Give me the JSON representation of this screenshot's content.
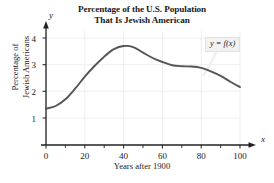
{
  "chart_data": {
    "type": "line",
    "title": "Percentage of the U.S. Population That Is Jewish American",
    "title_line1": "Percentage of the U.S. Population",
    "title_line2": "That Is Jewish American",
    "xlabel": "Years after 1900",
    "ylabel": "Percentage of Jewish Americans",
    "ylabel_line1": "Percentage of",
    "ylabel_line2": "Jewish Americans",
    "x_axis_variable": "x",
    "y_axis_variable": "y",
    "xlim": [
      0,
      105
    ],
    "ylim": [
      0,
      4.35
    ],
    "xticks": [
      0,
      20,
      40,
      60,
      80,
      100
    ],
    "xtick_labels": [
      "0",
      "20",
      "40",
      "60",
      "80",
      "100"
    ],
    "xminorticks": [
      10,
      30,
      50,
      70,
      90
    ],
    "yticks": [
      1,
      2,
      3,
      4
    ],
    "ytick_labels": [
      "1",
      "2",
      "3",
      "4"
    ],
    "grid": true,
    "grid_color": "#e8e8e8",
    "legend": "y = f(x)",
    "legend_position": "upper-right",
    "curve_color": "#555555",
    "curve_width": 1.9,
    "x": [
      0,
      5,
      10,
      15,
      20,
      25,
      30,
      35,
      40,
      45,
      50,
      55,
      60,
      65,
      70,
      75,
      80,
      85,
      90,
      95,
      100
    ],
    "values": [
      1.35,
      1.45,
      1.7,
      2.1,
      2.55,
      2.95,
      3.3,
      3.58,
      3.7,
      3.66,
      3.45,
      3.25,
      3.1,
      2.98,
      2.94,
      2.93,
      2.88,
      2.75,
      2.58,
      2.36,
      2.16
    ],
    "annotations": [
      {
        "text": "y = f(x)",
        "x": 88,
        "y": 3.95,
        "leader_to_x": 82,
        "leader_to_y": 2.9
      }
    ]
  }
}
